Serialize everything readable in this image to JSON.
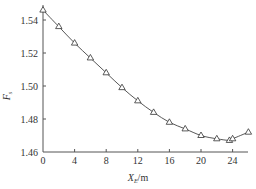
{
  "chart_data": {
    "type": "line",
    "title": "",
    "xlabel": "X_E/m",
    "ylabel": "F_s",
    "xlabel_main": "X",
    "xlabel_sub": "E",
    "xlabel_unit": "/m",
    "ylabel_main": "F",
    "ylabel_sub": "s",
    "xlim": [
      0,
      26
    ],
    "ylim": [
      1.46,
      1.55
    ],
    "xticks": [
      0,
      4,
      8,
      12,
      16,
      20,
      24
    ],
    "xtick_labels": [
      "0",
      "4",
      "8",
      "12",
      "16",
      "20",
      "24"
    ],
    "yticks": [
      1.46,
      1.48,
      1.5,
      1.52,
      1.54
    ],
    "ytick_labels": [
      "1.46",
      "1.48",
      "1.50",
      "1.52",
      "1.54"
    ],
    "grid": false,
    "legend": null,
    "series": [
      {
        "name": "F_s",
        "marker": "triangle-open",
        "line": "smooth",
        "x": [
          0,
          2,
          4,
          6,
          8,
          10,
          12,
          14,
          16,
          18,
          20,
          22,
          23.6,
          24,
          26
        ],
        "values": [
          1.546,
          1.536,
          1.526,
          1.517,
          1.508,
          1.499,
          1.491,
          1.484,
          1.478,
          1.474,
          1.47,
          1.468,
          1.467,
          1.468,
          1.472
        ]
      }
    ]
  }
}
